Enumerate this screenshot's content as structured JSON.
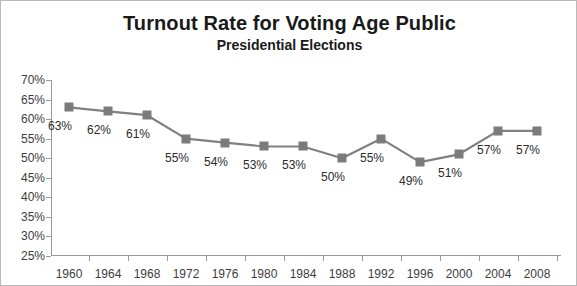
{
  "chart_data": {
    "type": "line",
    "title": "Turnout Rate for Voting Age Public",
    "subtitle": "Presidential Elections",
    "xlabel": "",
    "ylabel": "",
    "categories": [
      "1960",
      "1964",
      "1968",
      "1972",
      "1976",
      "1980",
      "1984",
      "1988",
      "1992",
      "1996",
      "2000",
      "2004",
      "2008"
    ],
    "values": [
      63,
      62,
      61,
      55,
      54,
      53,
      53,
      50,
      55,
      49,
      51,
      57,
      57
    ],
    "point_labels": [
      "63%",
      "62%",
      "61%",
      "55%",
      "54%",
      "53%",
      "53%",
      "50%",
      "55%",
      "49%",
      "51%",
      "57%",
      "57%"
    ],
    "ytick_labels": [
      "70%",
      "65%",
      "60%",
      "55%",
      "50%",
      "45%",
      "40%",
      "35%",
      "30%",
      "25%"
    ],
    "ytick_values": [
      70,
      65,
      60,
      55,
      50,
      45,
      40,
      35,
      30,
      25
    ],
    "ylim": [
      25,
      70
    ],
    "grid": false,
    "legend": "none",
    "series_color": "#7b7b7b",
    "line_color": "#808080",
    "axis_color": "#9a9a9a",
    "background": "#ffffff",
    "border_color": "#b9b9b9"
  }
}
